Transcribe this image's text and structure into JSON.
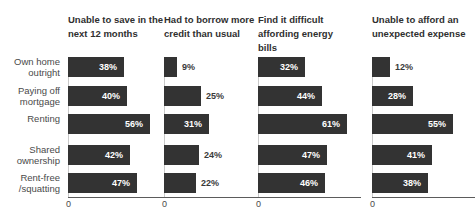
{
  "chart_data": {
    "type": "bar",
    "orientation": "horizontal",
    "layout": "small-multiples",
    "title": "",
    "xlabel": "",
    "ylabel": "",
    "grid": false,
    "legend": false,
    "value_suffix": "%",
    "xlim": [
      0,
      70
    ],
    "axis_ticks": [
      "0"
    ],
    "categories": [
      "Own home\noutright",
      "Paying off\nmortgage",
      "Renting",
      "Shared\nownership",
      "Rent-free\n/squatting"
    ],
    "series": [
      {
        "name": "Unable to save in the next 12 months",
        "values": [
          38,
          40,
          56,
          42,
          47
        ],
        "labels": [
          "38%",
          "40%",
          "56%",
          "42%",
          "47%"
        ]
      },
      {
        "name": "Had to borrow more credit than usual",
        "values": [
          9,
          25,
          31,
          24,
          22
        ],
        "labels": [
          "9%",
          "25%",
          "31%",
          "24%",
          "22%"
        ]
      },
      {
        "name": "Find it difficult affording energy bills",
        "values": [
          32,
          44,
          61,
          47,
          46
        ],
        "labels": [
          "32%",
          "44%",
          "61%",
          "47%",
          "46%"
        ]
      },
      {
        "name": "Unable to afford an unexpected expense",
        "values": [
          12,
          28,
          55,
          41,
          38
        ],
        "labels": [
          "12%",
          "28%",
          "55%",
          "41%",
          "38%"
        ]
      }
    ],
    "colors": {
      "bar": "#333333",
      "label_inside": "#ffffff",
      "label_outside": "#3a3a3a",
      "axis": "#5b5b5b",
      "text": "#4a4a4a"
    }
  }
}
